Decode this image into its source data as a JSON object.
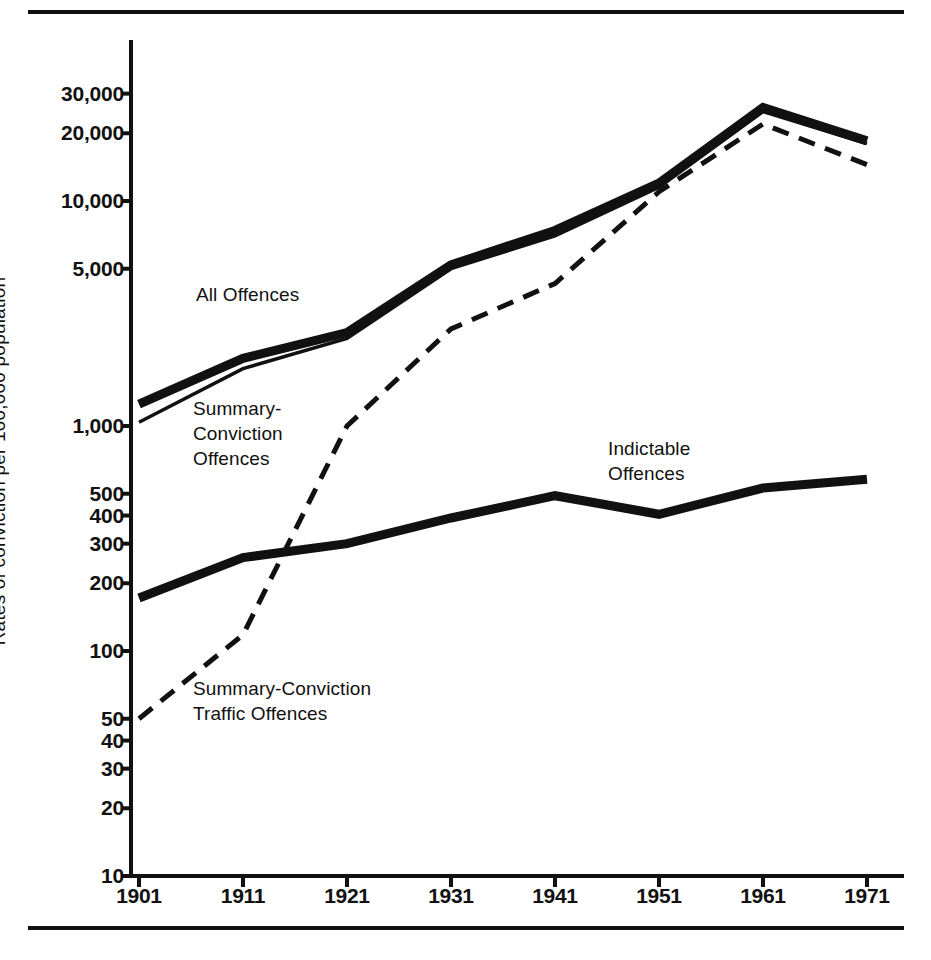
{
  "chart_data": {
    "type": "line",
    "title": "",
    "subtitle": "",
    "xlabel": "",
    "ylabel": "Rates of conviction per 100,000 population",
    "x": [
      1901,
      1911,
      1921,
      1931,
      1941,
      1951,
      1961,
      1971
    ],
    "xtick_labels": [
      "1901",
      "1911",
      "1921",
      "1931",
      "1941",
      "1951",
      "1961",
      "1971"
    ],
    "ytick_values": [
      10,
      20,
      30,
      40,
      50,
      100,
      200,
      300,
      400,
      500,
      1000,
      5000,
      10000,
      20000,
      30000
    ],
    "ytick_labels": [
      "10",
      "20",
      "30",
      "40",
      "50",
      "100",
      "200",
      "300",
      "400",
      "500",
      "1,000",
      "5,000",
      "10,000",
      "20,000",
      "30,000"
    ],
    "yscale": "log",
    "ylim": [
      10,
      40000
    ],
    "grid": false,
    "legend_position": "inline-annotations",
    "series": [
      {
        "name": "All Offences",
        "style": "solid-thick",
        "color": "#111111",
        "values": [
          1250,
          2000,
          2600,
          5200,
          7400,
          12000,
          26000,
          18500
        ]
      },
      {
        "name": "Summary-Conviction Offences",
        "style": "solid-thin",
        "color": "#111111",
        "values": [
          1040,
          1800,
          2450,
          5000,
          7000,
          11500,
          25000,
          18000
        ]
      },
      {
        "name": "Indictable Offences",
        "style": "solid-thick",
        "color": "#111111",
        "values": [
          172,
          260,
          300,
          390,
          490,
          405,
          530,
          580
        ]
      },
      {
        "name": "Summary-Conviction Traffic Offences",
        "style": "dashed",
        "color": "#111111",
        "values": [
          50,
          118,
          1000,
          2700,
          4300,
          11000,
          22000,
          14500
        ]
      }
    ],
    "annotations": [
      {
        "text": "All Offences",
        "series": "All Offences"
      },
      {
        "text": "Summary-\nConviction\nOffences",
        "series": "Summary-Conviction Offences"
      },
      {
        "text": "Indictable\nOffences",
        "series": "Indictable Offences"
      },
      {
        "text": "Summary-Conviction\nTraffic Offences",
        "series": "Summary-Conviction Traffic Offences"
      }
    ]
  },
  "figure": {
    "top_rule": "",
    "bottom_rule": "",
    "background_color": "#ffffff",
    "ink_color": "#111111"
  }
}
